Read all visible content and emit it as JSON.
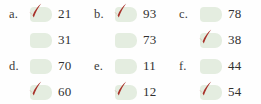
{
  "colors": {
    "background": "#fefefe",
    "checkbox_fill": "#e4ede0",
    "checkmark": "#a8322a",
    "text": "#303030",
    "label_text": "#3a3a3a"
  },
  "quiz": {
    "items": [
      {
        "label": "a.",
        "options": [
          {
            "value": "21",
            "checked": true
          },
          {
            "value": "31",
            "checked": false
          }
        ]
      },
      {
        "label": "b.",
        "options": [
          {
            "value": "93",
            "checked": true
          },
          {
            "value": "73",
            "checked": false
          }
        ]
      },
      {
        "label": "c.",
        "options": [
          {
            "value": "78",
            "checked": false
          },
          {
            "value": "38",
            "checked": true
          }
        ]
      },
      {
        "label": "d.",
        "options": [
          {
            "value": "70",
            "checked": false
          },
          {
            "value": "60",
            "checked": true
          }
        ]
      },
      {
        "label": "e.",
        "options": [
          {
            "value": "11",
            "checked": false
          },
          {
            "value": "12",
            "checked": true
          }
        ]
      },
      {
        "label": "f.",
        "options": [
          {
            "value": "44",
            "checked": false
          },
          {
            "value": "54",
            "checked": true
          }
        ]
      }
    ]
  },
  "icons": {
    "check": "checkmark-icon"
  }
}
